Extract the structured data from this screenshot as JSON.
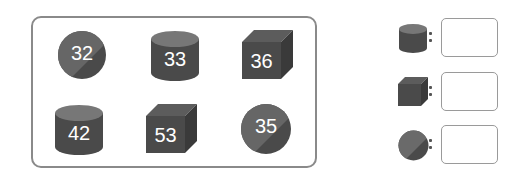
{
  "colors": {
    "shape_fill": "#4a4a4a",
    "shape_light": "#6e6e6e",
    "shape_top": "#7a7a7a",
    "panel_border": "#8a8a8a",
    "box_border": "#9a9a9a",
    "label_text": "#ffffff"
  },
  "panel": {
    "items": [
      {
        "shape": "sphere",
        "value": "32"
      },
      {
        "shape": "cylinder",
        "value": "33"
      },
      {
        "shape": "cube",
        "value": "36"
      },
      {
        "shape": "cylinder",
        "value": "42"
      },
      {
        "shape": "cube",
        "value": "53"
      },
      {
        "shape": "sphere",
        "value": "35"
      }
    ]
  },
  "legend": {
    "rows": [
      {
        "shape": "cylinder",
        "separator": ":",
        "answer": ""
      },
      {
        "shape": "cube",
        "separator": ":",
        "answer": ""
      },
      {
        "shape": "sphere",
        "separator": ":",
        "answer": ""
      }
    ]
  }
}
